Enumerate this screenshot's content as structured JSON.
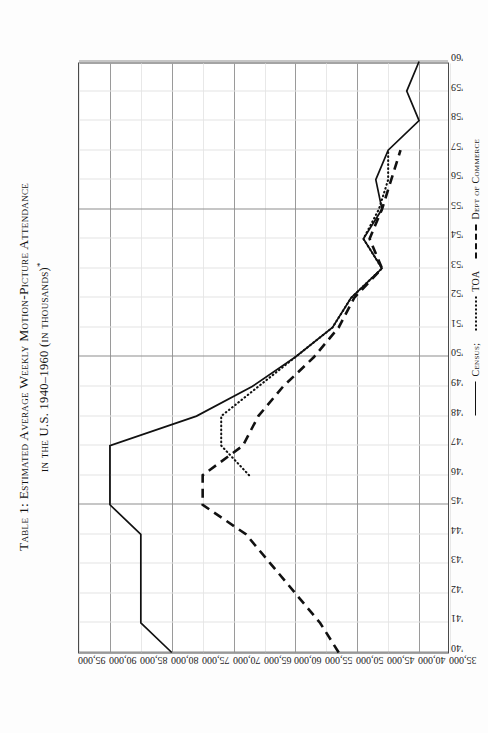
{
  "caption": {
    "line1": "Table 1:  Estimated Average Weekly Motion-Picture Attendance",
    "line2": "in the U.S. 1940–1960 (in thousands)",
    "footnote_marker": "*"
  },
  "legend": {
    "position": "below-axis-right",
    "items": [
      {
        "label": "Census;",
        "style": "solid"
      },
      {
        "label": "TOA",
        "style": "dotted"
      },
      {
        "label": "Dept of Commerce",
        "style": "dashed"
      }
    ]
  },
  "chart_data": {
    "type": "line",
    "title": "Table 1:  Estimated Average Weekly Motion-Picture Attendance in the U.S. 1940–1960 (in thousands)*",
    "xlabel": "",
    "ylabel": "",
    "grid": true,
    "orientation": "rotated-90",
    "xlim": [
      1940,
      1960
    ],
    "ylim": [
      35000,
      95000
    ],
    "ytick_step": 5000,
    "x": [
      1940,
      1941,
      1942,
      1943,
      1944,
      1945,
      1946,
      1947,
      1948,
      1949,
      1950,
      1951,
      1952,
      1953,
      1954,
      1955,
      1956,
      1957,
      1958,
      1959,
      1960
    ],
    "xtick_labels": [
      "'40",
      "'41",
      "'42",
      "'43",
      "'44",
      "'45",
      "'46",
      "'47",
      "'48",
      "'49",
      "'50",
      "'51",
      "'52",
      "'53",
      "'54",
      "'55",
      "'56",
      "'57",
      "'58",
      "'59",
      "'60"
    ],
    "ytick_labels": [
      "95,000",
      "90,000",
      "85,000",
      "80,000",
      "75,000",
      "70,000",
      "65,000",
      "60,000",
      "55,000",
      "50,000",
      "45,000",
      "40,000",
      "35,000"
    ],
    "ytick_values": [
      95000,
      90000,
      85000,
      80000,
      75000,
      70000,
      65000,
      60000,
      55000,
      50000,
      45000,
      40000,
      35000
    ],
    "series": [
      {
        "name": "Census;",
        "style": "solid",
        "x": [
          1940,
          1941,
          1942,
          1943,
          1944,
          1945,
          1946,
          1947,
          1948,
          1949,
          1950,
          1951,
          1952,
          1953,
          1954,
          1955,
          1956,
          1957,
          1958,
          1959,
          1960
        ],
        "values": [
          80000,
          85000,
          85000,
          85000,
          85000,
          90000,
          90000,
          90000,
          76000,
          67000,
          60000,
          54000,
          51000,
          46000,
          49000,
          46000,
          47000,
          45000,
          40000,
          42000,
          40000
        ]
      },
      {
        "name": "TOA",
        "style": "dotted",
        "x": [
          1946,
          1947,
          1948,
          1949,
          1950,
          1951,
          1952,
          1953,
          1954,
          1955,
          1956,
          1957
        ],
        "values": [
          67500,
          72000,
          72000,
          66000,
          60000,
          54000,
          51000,
          46000,
          49000,
          46500,
          45000,
          45000
        ]
      },
      {
        "name": "Dept of Commerce",
        "style": "dashed",
        "x": [
          1940,
          1941,
          1942,
          1943,
          1944,
          1945,
          1946,
          1947,
          1948,
          1949,
          1950,
          1951,
          1952,
          1953,
          1954,
          1955,
          1956,
          1957
        ],
        "values": [
          53000,
          56000,
          60000,
          64000,
          68000,
          75000,
          75000,
          68500,
          66000,
          62000,
          57000,
          53000,
          50500,
          46000,
          48000,
          46000,
          44500,
          43000
        ]
      }
    ]
  }
}
